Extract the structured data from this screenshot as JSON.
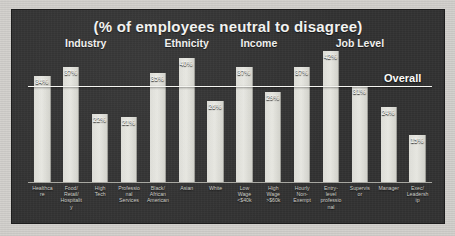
{
  "chart": {
    "title": "(% of employees neutral to disagree)",
    "overall_label": "Overall",
    "overall_value": 31,
    "background_color": "#303030",
    "bar_color": "#e0e0da",
    "text_color": "#f2f2f0"
  },
  "groups": [
    {
      "label": "Industry",
      "start": 0,
      "count": 4
    },
    {
      "label": "Ethnicity",
      "start": 4,
      "count": 3
    },
    {
      "label": "Income",
      "start": 7,
      "count": 2
    },
    {
      "label": "Job Level",
      "start": 9,
      "count": 5
    }
  ],
  "chart_data": {
    "type": "bar",
    "title": "(% of employees neutral to disagree)",
    "xlabel": "",
    "ylabel": "% of employees neutral to disagree",
    "ylim": [
      0,
      45
    ],
    "grid": false,
    "legend": false,
    "reference_line": {
      "label": "Overall",
      "value": 31
    },
    "categories": [
      "Healthcare",
      "Food/ Retail/ Hospitality",
      "High Tech",
      "Professional Services",
      "Black/ African American",
      "Asian",
      "White",
      "Low Wage <$40k",
      "High Wage >$60k",
      "Hourly Non-Exempt",
      "Entry-level professional",
      "Supervisor",
      "Manager",
      "Exec/ Leadership"
    ],
    "values": [
      34,
      37,
      22,
      21,
      35,
      40,
      26,
      37,
      29,
      37,
      42,
      31,
      24,
      15
    ],
    "value_labels": [
      "34%",
      "37%",
      "22%",
      "21%",
      "35%",
      "40%",
      "26%",
      "37%",
      "29%",
      "37%",
      "42%",
      "31%",
      "24%",
      "15%"
    ],
    "groups": [
      "Industry",
      "Industry",
      "Industry",
      "Industry",
      "Ethnicity",
      "Ethnicity",
      "Ethnicity",
      "Income",
      "Income",
      "Job Level",
      "Job Level",
      "Job Level",
      "Job Level",
      "Job Level"
    ]
  },
  "category_lines": [
    [
      "Healthcare"
    ],
    [
      "Food/",
      "Retail/",
      "Hospitality"
    ],
    [
      "High",
      "Tech"
    ],
    [
      "Professional",
      "Services"
    ],
    [
      "Black/",
      "African",
      "American"
    ],
    [
      "Asian"
    ],
    [
      "White"
    ],
    [
      "Low Wage",
      "<$40k"
    ],
    [
      "High Wage",
      ">$60k"
    ],
    [
      "Hourly",
      "Non-",
      "Exempt"
    ],
    [
      "Entry-level",
      "professional"
    ],
    [
      "Supervisor"
    ],
    [
      "Manager"
    ],
    [
      "Exec/",
      "Leadership"
    ]
  ]
}
